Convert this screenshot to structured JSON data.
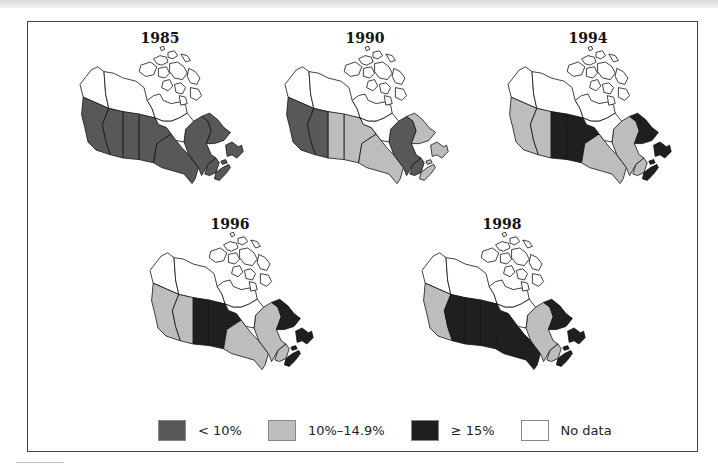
{
  "figure": {
    "colors": {
      "lt10": "#585858",
      "10to14_9": "#bdbdbd",
      "ge15": "#1f1f1f",
      "nodata": "#ffffff"
    },
    "panels": [
      {
        "year": "1985",
        "x": 60,
        "y": 30,
        "fills": {
          "BC": "lt10",
          "AB": "lt10",
          "SK": "lt10",
          "MB": "lt10",
          "ON": "lt10",
          "QC": "lt10",
          "LAB": "lt10",
          "NF": "lt10",
          "NB": "lt10",
          "NS": "lt10",
          "PE": "lt10",
          "YT": "nodata",
          "NT": "nodata",
          "NU": "nodata"
        }
      },
      {
        "year": "1990",
        "x": 265,
        "y": 30,
        "fills": {
          "BC": "lt10",
          "AB": "lt10",
          "SK": "10to14_9",
          "MB": "10to14_9",
          "ON": "10to14_9",
          "QC": "lt10",
          "LAB": "10to14_9",
          "NF": "10to14_9",
          "NB": "lt10",
          "NS": "10to14_9",
          "PE": "10to14_9",
          "YT": "nodata",
          "NT": "nodata",
          "NU": "nodata"
        }
      },
      {
        "year": "1994",
        "x": 488,
        "y": 30,
        "fills": {
          "BC": "10to14_9",
          "AB": "10to14_9",
          "SK": "ge15",
          "MB": "ge15",
          "ON": "10to14_9",
          "QC": "10to14_9",
          "LAB": "ge15",
          "NF": "ge15",
          "NB": "10to14_9",
          "NS": "ge15",
          "PE": "ge15",
          "YT": "nodata",
          "NT": "nodata",
          "NU": "nodata"
        }
      },
      {
        "year": "1996",
        "x": 130,
        "y": 216,
        "fills": {
          "BC": "10to14_9",
          "AB": "10to14_9",
          "SK": "ge15",
          "MB": "ge15",
          "ON": "10to14_9",
          "QC": "10to14_9",
          "LAB": "ge15",
          "NF": "ge15",
          "NB": "10to14_9",
          "NS": "ge15",
          "PE": "ge15",
          "YT": "nodata",
          "NT": "nodata",
          "NU": "nodata"
        }
      },
      {
        "year": "1998",
        "x": 402,
        "y": 216,
        "fills": {
          "BC": "10to14_9",
          "AB": "ge15",
          "SK": "ge15",
          "MB": "ge15",
          "ON": "ge15",
          "QC": "10to14_9",
          "LAB": "ge15",
          "NF": "ge15",
          "NB": "10to14_9",
          "NS": "ge15",
          "PE": "ge15",
          "YT": "nodata",
          "NT": "nodata",
          "NU": "nodata"
        }
      }
    ]
  },
  "legend": {
    "items": [
      {
        "key": "lt10",
        "label": "< 10%"
      },
      {
        "key": "10to14_9",
        "label": "10%–14.9%"
      },
      {
        "key": "ge15",
        "label": "≥ 15%"
      },
      {
        "key": "nodata",
        "label": "No data"
      }
    ]
  }
}
